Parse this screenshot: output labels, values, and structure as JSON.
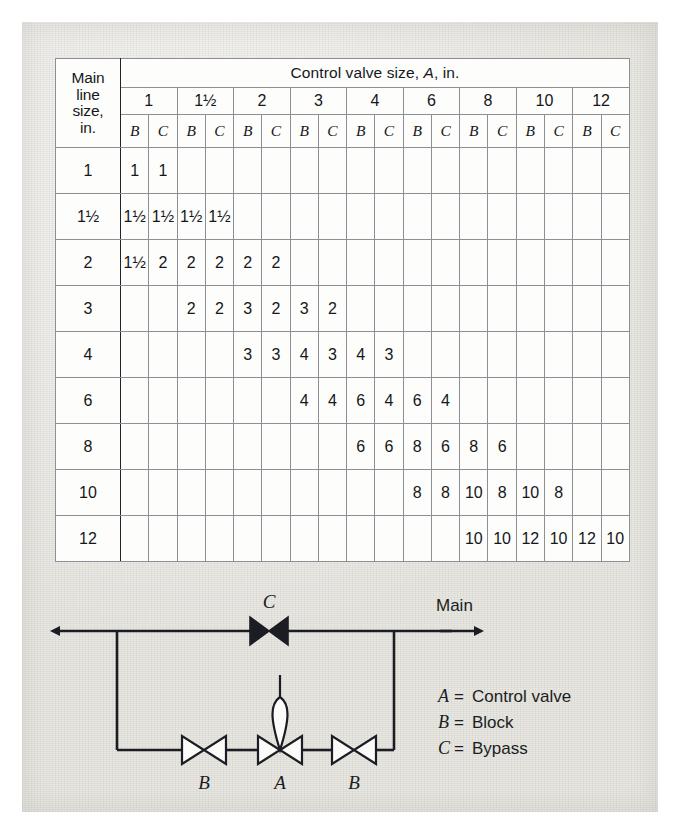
{
  "table": {
    "corner_label": "Main line size, in.",
    "corner_lines": [
      "Main",
      "line",
      "size,",
      "in."
    ],
    "span_header": "Control valve size, A, in.",
    "sub_headers": [
      "B",
      "C"
    ],
    "column_groups": [
      "1",
      "1½",
      "2",
      "3",
      "4",
      "6",
      "8",
      "10",
      "12"
    ],
    "row_labels": [
      "1",
      "1½",
      "2",
      "3",
      "4",
      "6",
      "8",
      "10",
      "12"
    ],
    "rows": [
      {
        "label": "1",
        "cells": [
          "1",
          "1",
          "",
          "",
          "",
          "",
          "",
          "",
          "",
          "",
          "",
          "",
          "",
          "",
          "",
          "",
          "",
          ""
        ]
      },
      {
        "label": "1½",
        "cells": [
          "1½",
          "1½",
          "1½",
          "1½",
          "",
          "",
          "",
          "",
          "",
          "",
          "",
          "",
          "",
          "",
          "",
          "",
          "",
          ""
        ]
      },
      {
        "label": "2",
        "cells": [
          "1½",
          "2",
          "2",
          "2",
          "2",
          "2",
          "",
          "",
          "",
          "",
          "",
          "",
          "",
          "",
          "",
          "",
          "",
          ""
        ]
      },
      {
        "label": "3",
        "cells": [
          "",
          "",
          "2",
          "2",
          "3",
          "2",
          "3",
          "2",
          "",
          "",
          "",
          "",
          "",
          "",
          "",
          "",
          "",
          ""
        ]
      },
      {
        "label": "4",
        "cells": [
          "",
          "",
          "",
          "",
          "3",
          "3",
          "4",
          "3",
          "4",
          "3",
          "",
          "",
          "",
          "",
          "",
          "",
          "",
          ""
        ]
      },
      {
        "label": "6",
        "cells": [
          "",
          "",
          "",
          "",
          "",
          "",
          "4",
          "4",
          "6",
          "4",
          "6",
          "4",
          "",
          "",
          "",
          "",
          "",
          ""
        ]
      },
      {
        "label": "8",
        "cells": [
          "",
          "",
          "",
          "",
          "",
          "",
          "",
          "",
          "6",
          "6",
          "8",
          "6",
          "8",
          "6",
          "",
          "",
          "",
          ""
        ]
      },
      {
        "label": "10",
        "cells": [
          "",
          "",
          "",
          "",
          "",
          "",
          "",
          "",
          "",
          "",
          "8",
          "8",
          "10",
          "8",
          "10",
          "8",
          "",
          ""
        ]
      },
      {
        "label": "12",
        "cells": [
          "",
          "",
          "",
          "",
          "",
          "",
          "",
          "",
          "",
          "",
          "",
          "",
          "10",
          "10",
          "12",
          "10",
          "12",
          "10"
        ]
      }
    ],
    "shading": [
      [
        1,
        1,
        0,
        0,
        0,
        0,
        0,
        0,
        0,
        0,
        0,
        0,
        0,
        0,
        0,
        0,
        0,
        0
      ],
      [
        1,
        1,
        1,
        1,
        0,
        0,
        0,
        0,
        0,
        0,
        0,
        0,
        0,
        0,
        0,
        0,
        0,
        0
      ],
      [
        1,
        1,
        1,
        1,
        1,
        1,
        0,
        0,
        0,
        0,
        0,
        0,
        0,
        0,
        0,
        0,
        0,
        0
      ],
      [
        0,
        0,
        1,
        1,
        1,
        1,
        1,
        1,
        0,
        0,
        0,
        0,
        0,
        0,
        0,
        0,
        0,
        0
      ],
      [
        0,
        0,
        0,
        0,
        1,
        1,
        1,
        1,
        1,
        1,
        0,
        0,
        0,
        0,
        0,
        0,
        0,
        0
      ],
      [
        0,
        0,
        0,
        0,
        0,
        0,
        1,
        1,
        1,
        1,
        1,
        1,
        0,
        0,
        0,
        0,
        0,
        0
      ],
      [
        0,
        0,
        0,
        0,
        0,
        0,
        0,
        0,
        1,
        1,
        1,
        1,
        1,
        1,
        0,
        0,
        0,
        0
      ],
      [
        0,
        0,
        0,
        0,
        0,
        0,
        0,
        0,
        0,
        0,
        1,
        1,
        1,
        1,
        1,
        1,
        0,
        0
      ],
      [
        0,
        0,
        0,
        0,
        0,
        0,
        0,
        0,
        0,
        0,
        0,
        0,
        1,
        1,
        1,
        1,
        1,
        1
      ]
    ]
  },
  "diagram": {
    "main_label": "Main",
    "bypass_valve_label": "C",
    "block_valve_left_label": "B",
    "control_valve_label": "A",
    "block_valve_right_label": "B",
    "legend": [
      {
        "key": "A",
        "eq": "=",
        "text": "Control valve"
      },
      {
        "key": "B",
        "eq": "=",
        "text": "Block"
      },
      {
        "key": "C",
        "eq": "=",
        "text": "Bypass"
      }
    ]
  },
  "colors": {
    "paper": "#e9e7e2",
    "table_bg": "#fdfdfb",
    "shaded_cell": "#dcdad5",
    "ink": "#15171c",
    "grid": "#8d8f95",
    "heavy_rule": "#22242a"
  }
}
